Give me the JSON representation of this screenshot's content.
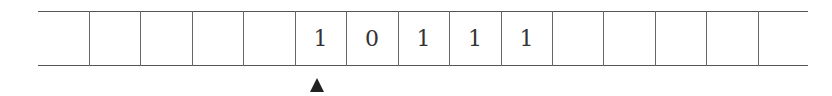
{
  "tape": {
    "cells": [
      "",
      "",
      "",
      "",
      "",
      "1",
      "0",
      "1",
      "1",
      "1",
      "",
      "",
      "",
      "",
      ""
    ],
    "head_position": 5,
    "head_symbol": "triangle-up"
  }
}
